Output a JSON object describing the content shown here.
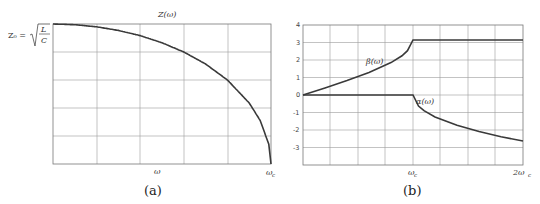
{
  "chart_data": [
    {
      "id": "a",
      "type": "line",
      "caption": "(a)",
      "title": "Z(ω)",
      "xlabel": "",
      "x_tick_labels": [
        "ω",
        "ω_c"
      ],
      "y_tick_labels": [
        "Z₀ = √(L/C)"
      ],
      "ylabel": "",
      "grid": true,
      "xlim": [
        0,
        1
      ],
      "ylim": [
        0,
        1
      ],
      "series": [
        {
          "name": "Z(ω)",
          "x": [
            0,
            0.1,
            0.2,
            0.3,
            0.4,
            0.5,
            0.6,
            0.7,
            0.8,
            0.9,
            0.95,
            0.99,
            1.0
          ],
          "values": [
            1.0,
            0.995,
            0.98,
            0.954,
            0.917,
            0.866,
            0.8,
            0.714,
            0.6,
            0.436,
            0.312,
            0.141,
            0.0
          ]
        }
      ]
    },
    {
      "id": "b",
      "type": "line",
      "caption": "(b)",
      "title": "",
      "xlabel": "",
      "x_tick_labels": [
        "ω_c",
        "2ω_c"
      ],
      "y_ticks": [
        4,
        3,
        2,
        1,
        0,
        -1,
        -2,
        -3
      ],
      "grid": true,
      "xlim": [
        0,
        2
      ],
      "ylim": [
        -4,
        4
      ],
      "series": [
        {
          "name": "β(ω)",
          "x": [
            0,
            0.2,
            0.4,
            0.6,
            0.8,
            0.9,
            0.95,
            1.0,
            1.5,
            2.0
          ],
          "values": [
            0,
            0.4,
            0.82,
            1.29,
            1.85,
            2.24,
            2.53,
            3.14,
            3.14,
            3.14
          ]
        },
        {
          "name": "α(ω)",
          "x": [
            0,
            0.5,
            1.0,
            1.05,
            1.1,
            1.2,
            1.4,
            1.6,
            1.8,
            2.0
          ],
          "values": [
            0,
            0,
            0,
            -0.63,
            -0.89,
            -1.25,
            -1.73,
            -2.09,
            -2.39,
            -2.63
          ]
        }
      ]
    }
  ],
  "labels": {
    "a_title": "Z(ω)",
    "a_z0": "Z₀ =",
    "a_sqrt_num": "L",
    "a_sqrt_den": "C",
    "a_x_omega": "ω",
    "a_x_omegac": "ω",
    "a_x_omegac_sub": "c",
    "a_caption": "(a)",
    "b_beta": "β(ω)",
    "b_alpha": "α(ω)",
    "b_x_omegac": "ω",
    "b_x_omegac_sub": "c",
    "b_x_2omegac": "2ω",
    "b_x_2omegac_sub": "c",
    "b_caption": "(b)",
    "b_yticks": [
      "4",
      "3",
      "2",
      "1",
      "0",
      "-1",
      "-2",
      "-3"
    ]
  }
}
